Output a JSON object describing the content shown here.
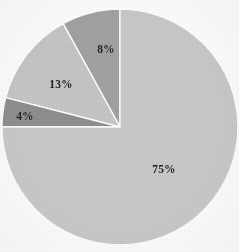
{
  "chart_data": {
    "type": "pie",
    "title": "",
    "subtitle": "",
    "xlabel": "",
    "ylabel": "",
    "legend_position": "none",
    "grid": false,
    "labels_shown": true,
    "start_angle_deg": 0,
    "direction": "counterclockwise",
    "categories": [
      "75%",
      "8%",
      "13%",
      "4%"
    ],
    "values": [
      75,
      8,
      13,
      4
    ],
    "unit": "percent",
    "slices": [
      {
        "label": "75%",
        "value": 75,
        "color": "#c9c9c9",
        "angle_deg": 270,
        "label_x": 164,
        "label_y": 170
      },
      {
        "label": "8%",
        "value": 8,
        "color": "#a2a2a2",
        "angle_deg": 28.8,
        "label_x": 106,
        "label_y": 50
      },
      {
        "label": "13%",
        "value": 13,
        "color": "#c6c6c6",
        "angle_deg": 46.8,
        "label_x": 61,
        "label_y": 85
      },
      {
        "label": "4%",
        "value": 4,
        "color": "#8f8f8f",
        "angle_deg": 14.4,
        "label_x": 25,
        "label_y": 117
      }
    ],
    "geometry": {
      "center_x": 120,
      "center_y": 127,
      "radius": 118,
      "separator_color": "#ffffff",
      "separator_width": 1.4
    },
    "background_color": "#fdfdfd",
    "label_text_color": "#1c1c1c"
  }
}
